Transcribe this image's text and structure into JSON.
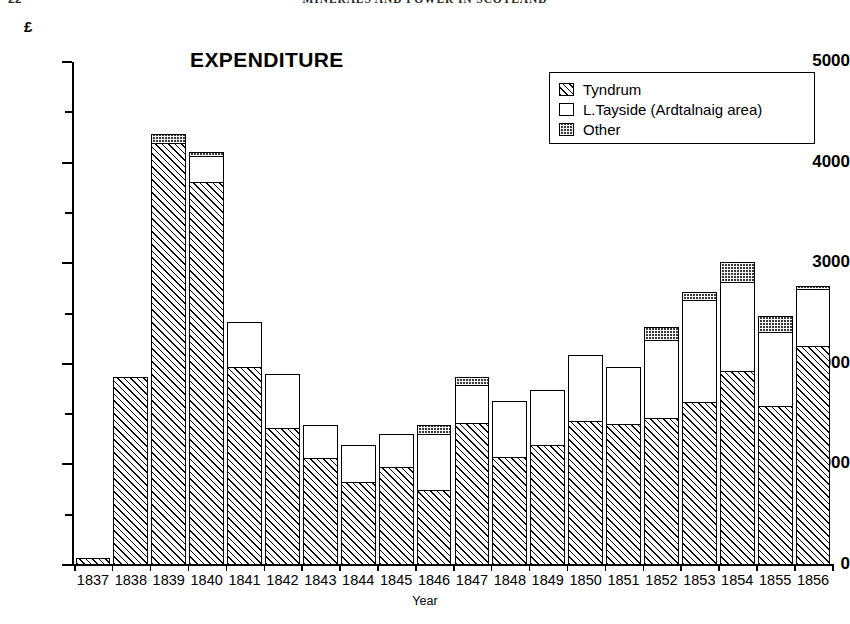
{
  "header": {
    "page_number": "22",
    "running_title": "MINERALS AND POWER IN SCOTLAND"
  },
  "chart_title": "EXPENDITURE",
  "axes": {
    "y_unit_symbol": "£",
    "x_title": "Year",
    "y_major_ticks": [
      "5000",
      "4000",
      "3000",
      "2000",
      "1000",
      "0"
    ]
  },
  "legend": {
    "items": [
      {
        "label": "Tyndrum",
        "pattern": "diagonal-hatch"
      },
      {
        "label": "L.Tayside (Ardtalnaig area)",
        "pattern": "open-white"
      },
      {
        "label": "Other",
        "pattern": "stipple-dark"
      }
    ]
  },
  "chart_data": {
    "type": "bar",
    "subtype": "stacked",
    "title": "EXPENDITURE",
    "xlabel": "Year",
    "ylabel": "£",
    "ylim": [
      0,
      5000
    ],
    "ytick_step_major": 1000,
    "ytick_step_minor": 500,
    "grid": false,
    "legend_position": "top-right",
    "categories": [
      "1837",
      "1838",
      "1839",
      "1840",
      "1841",
      "1842",
      "1843",
      "1844",
      "1845",
      "1846",
      "1847",
      "1848",
      "1849",
      "1850",
      "1851",
      "1852",
      "1853",
      "1854",
      "1855",
      "1856"
    ],
    "series": [
      {
        "name": "Tyndrum",
        "values": [
          60,
          1860,
          4190,
          3800,
          1960,
          1350,
          1050,
          820,
          960,
          740,
          1400,
          1060,
          1180,
          1420,
          1390,
          1450,
          1610,
          1920,
          1570,
          2170
        ]
      },
      {
        "name": "L.Tayside (Ardtalnaig area)",
        "values": [
          0,
          0,
          0,
          260,
          440,
          540,
          330,
          360,
          330,
          550,
          380,
          560,
          550,
          650,
          570,
          780,
          1010,
          880,
          740,
          560
        ]
      },
      {
        "name": "Other",
        "values": [
          0,
          0,
          80,
          30,
          0,
          0,
          0,
          0,
          0,
          90,
          80,
          0,
          0,
          0,
          0,
          120,
          80,
          200,
          150,
          30
        ]
      }
    ],
    "totals": [
      60,
      1860,
      4270,
      4090,
      2400,
      1890,
      1380,
      1180,
      1290,
      1380,
      1860,
      1620,
      1730,
      2070,
      1960,
      2350,
      2700,
      3000,
      2460,
      2760
    ]
  }
}
